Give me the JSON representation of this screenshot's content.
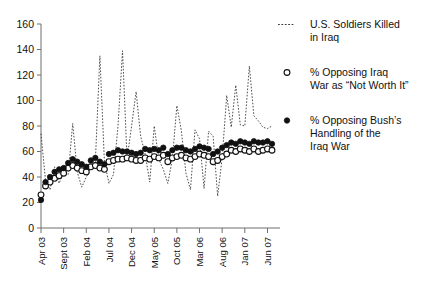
{
  "chart_data": {
    "type": "line",
    "title": "",
    "xlabel": "",
    "ylabel": "",
    "ylim": [
      0,
      160
    ],
    "y_ticks": [
      0,
      20,
      40,
      60,
      80,
      100,
      120,
      140,
      160
    ],
    "grid": false,
    "legend_position": "right",
    "x_tick_labels": [
      "Apr 03",
      "Sept 03",
      "Feb 04",
      "Jul 04",
      "Dec 04",
      "May 05",
      "Oct 05",
      "Mar 06",
      "Aug 06",
      "Jan 07",
      "Jun 07"
    ],
    "x_index_range": [
      0,
      51
    ],
    "x_tick_indices": [
      0,
      5,
      10,
      15,
      20,
      25,
      30,
      35,
      40,
      45,
      50
    ],
    "series": [
      {
        "name": "U.S. Soldiers Killed in Iraq",
        "marker": "none",
        "style": "dashed",
        "color": "#3a3a3a",
        "values": [
          74,
          37,
          30,
          48,
          35,
          44,
          42,
          82,
          44,
          32,
          40,
          47,
          52,
          135,
          52,
          35,
          42,
          80,
          139,
          54,
          80,
          107,
          72,
          58,
          36,
          80,
          54,
          46,
          35,
          54,
          96,
          76,
          43,
          30,
          77,
          70,
          31,
          76,
          72,
          25,
          55,
          104,
          79,
          112,
          81,
          80,
          127,
          88,
          84,
          79,
          78,
          80
        ]
      },
      {
        "name": "% Opposing Iraq War as \"Not Worth It\"",
        "marker": "open-circle",
        "style": "markers",
        "color": "#111111",
        "values": [
          26,
          33,
          36,
          39,
          41,
          43,
          47,
          49,
          47,
          45,
          44,
          48,
          49,
          47,
          46,
          52,
          53,
          54,
          54,
          55,
          54,
          53,
          53,
          55,
          54,
          56,
          55,
          57,
          52,
          55,
          56,
          57,
          55,
          54,
          56,
          58,
          57,
          56,
          52,
          53,
          56,
          58,
          61,
          60,
          62,
          61,
          60,
          62,
          60,
          61,
          62,
          61
        ]
      },
      {
        "name": "% Opposing Bush's Handling of the Iraq War",
        "marker": "filled-circle",
        "style": "markers",
        "color": "#111111",
        "values": [
          22,
          36,
          40,
          44,
          46,
          47,
          51,
          54,
          52,
          50,
          48,
          53,
          55,
          52,
          50,
          58,
          59,
          61,
          60,
          60,
          59,
          58,
          59,
          62,
          61,
          62,
          61,
          63,
          58,
          61,
          63,
          63,
          61,
          60,
          62,
          64,
          63,
          62,
          58,
          60,
          63,
          65,
          67,
          66,
          68,
          67,
          66,
          68,
          67,
          67,
          68,
          66
        ]
      }
    ]
  },
  "legend": {
    "items": [
      {
        "marker": "dashed-line",
        "label_lines": [
          "U.S. Soldiers Killed",
          "in Iraq"
        ]
      },
      {
        "marker": "open-circle",
        "label_lines": [
          "% Opposing Iraq",
          "War as “Not Worth It”"
        ]
      },
      {
        "marker": "filled-circle",
        "label_lines": [
          "% Opposing Bush’s",
          "Handling of the",
          "Iraq War"
        ]
      }
    ]
  }
}
